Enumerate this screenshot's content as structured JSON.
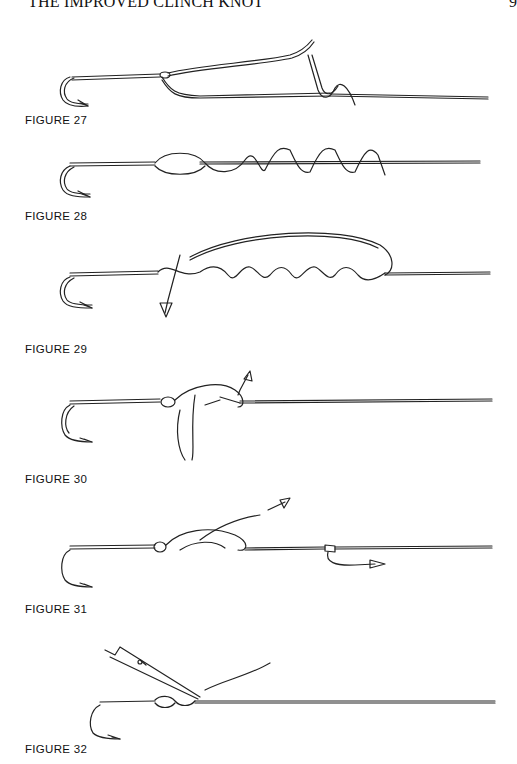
{
  "page": {
    "header_title": "THE IMPROVED CLINCH KNOT",
    "page_number": "9"
  },
  "figures": [
    {
      "id": 27,
      "caption": "FIGURE 27",
      "description": "Line passed through hook eye, tag end begins wrapping around standing line"
    },
    {
      "id": 28,
      "caption": "FIGURE 28",
      "description": "Tag end wrapped several turns around standing line"
    },
    {
      "id": 29,
      "caption": "FIGURE 29",
      "description": "Tag end brought back and passed through loop near eye, arrow pointing down"
    },
    {
      "id": 30,
      "caption": "FIGURE 30",
      "description": "Tag end passed through the big loop, arrow pointing up"
    },
    {
      "id": 31,
      "caption": "FIGURE 31",
      "description": "Knot drawn tight, arrows showing pull directions"
    },
    {
      "id": 32,
      "caption": "FIGURE 32",
      "description": "Scissors trimming the tag end of the finished knot"
    }
  ]
}
